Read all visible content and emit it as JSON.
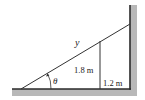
{
  "diagram": {
    "type": "ladder-over-fence geometry",
    "labels": {
      "ladder_length": "y",
      "angle": "θ",
      "fence_height": "1.8 m",
      "fence_to_wall": "1.2 m"
    },
    "colors": {
      "line": "#2a2a2a",
      "hatch": "#b8b8b8",
      "background": "#ffffff"
    }
  }
}
